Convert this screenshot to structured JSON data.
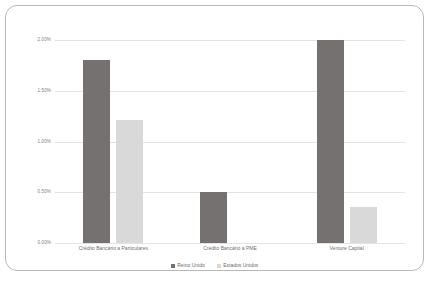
{
  "chart_data": {
    "type": "bar",
    "title": "",
    "subtitle": "",
    "xlabel": "",
    "ylabel": "",
    "ylim": [
      0,
      2.0
    ],
    "ytick_labels": [
      "2.00%",
      "1.50%",
      "1.00%",
      "0.50%",
      "0.00%"
    ],
    "ytick_values": [
      2.0,
      1.5,
      1.0,
      0.5,
      0.0
    ],
    "grid": true,
    "legend_position": "bottom",
    "categories": [
      "Crédito Bancário a Particulares",
      "Crédito Bancário a PME",
      "Venture Capital"
    ],
    "series": [
      {
        "name": "Reino Unido",
        "color": "#767171",
        "values": [
          1.8,
          0.5,
          2.0
        ],
        "value_labels": [
          "1.80%",
          "0.50%",
          "2.00%"
        ]
      },
      {
        "name": "Estados Unidos",
        "color": "#d9d9d9",
        "values": [
          1.21,
          0.0,
          0.35
        ],
        "value_labels": [
          "1.21%",
          "0.00%",
          "0.35%"
        ]
      }
    ]
  },
  "card": {
    "border_color": "#b8b8b8",
    "background": "#ffffff"
  },
  "axis": {
    "gridline_color": "#e3e3e3",
    "label_color": "#808080"
  }
}
